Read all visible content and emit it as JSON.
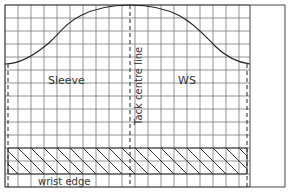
{
  "diagram": {
    "type": "sewing-pattern-sleeve-on-grid",
    "labels": {
      "sleeve": "Sleeve",
      "ws": "WS",
      "tack_centre_line": "Tack centre line",
      "wrist_edge": "wrist edge"
    },
    "colors": {
      "line": "#222222",
      "grid": "#555555",
      "background": "#ffffff",
      "text": "#333333"
    },
    "grid": {
      "x0": 5,
      "y0": 5,
      "x1": 250,
      "y1": 187,
      "spacing": 13
    },
    "frame": {
      "x0": 5,
      "y0": 5,
      "x1": 285,
      "y1": 187
    },
    "sleeve_head_curve": {
      "start": [
        8,
        64
      ],
      "peak": [
        130,
        5
      ],
      "end": [
        247,
        64
      ]
    },
    "dashed_lines": [
      {
        "name": "left-edge",
        "x": 8,
        "y0": 64,
        "y1": 187
      },
      {
        "name": "tack-centre-line",
        "x": 130,
        "y0": 5,
        "y1": 187
      },
      {
        "name": "right-edge",
        "x": 247,
        "y0": 64,
        "y1": 187
      }
    ],
    "hatched_band": {
      "x0": 8,
      "y0": 148,
      "x1": 247,
      "y1": 174,
      "label": "wrist edge"
    }
  }
}
